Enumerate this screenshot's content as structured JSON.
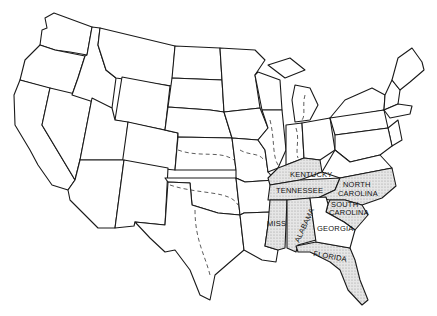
{
  "map": {
    "title": "United States map highlighting southern states",
    "colors": {
      "shaded": "#d8d8d8",
      "outline": "#1a1a1a",
      "background": "#ffffff"
    },
    "labels": [
      {
        "id": "kentucky",
        "text": "KENTUCKY",
        "x": 290,
        "y": 177,
        "rotate": 0
      },
      {
        "id": "tennessee",
        "text": "TENNESSEE",
        "x": 276,
        "y": 193,
        "rotate": 0
      },
      {
        "id": "north-carolina-1",
        "text": "NORTH",
        "x": 343,
        "y": 187,
        "rotate": 0
      },
      {
        "id": "north-carolina-2",
        "text": "CAROLINA",
        "x": 338,
        "y": 196,
        "rotate": 0
      },
      {
        "id": "south-carolina-1",
        "text": "SOUTH",
        "x": 331,
        "y": 205,
        "rotate": 0
      },
      {
        "id": "south-carolina-2",
        "text": "CAROLINA",
        "x": 329,
        "y": 213,
        "rotate": 0
      },
      {
        "id": "miss",
        "text": "MISS",
        "x": 266,
        "y": 226,
        "rotate": 0
      },
      {
        "id": "alabama",
        "text": "ALABAMA",
        "x": 299,
        "y": 242,
        "rotate": -65
      },
      {
        "id": "georgia",
        "text": "GEORGIA",
        "x": 316,
        "y": 231,
        "rotate": 0
      },
      {
        "id": "florida",
        "text": "FLORIDA",
        "x": 313,
        "y": 256,
        "rotate": 10
      }
    ]
  }
}
